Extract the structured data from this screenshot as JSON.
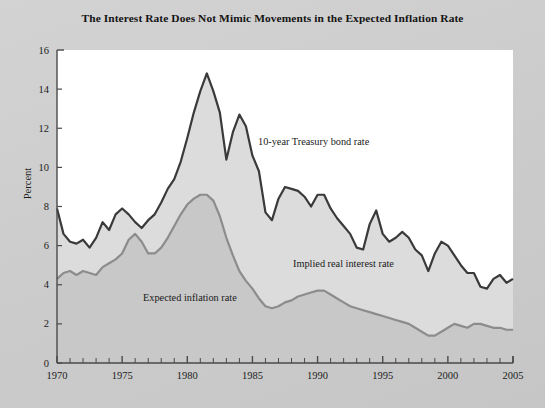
{
  "figure": {
    "title": "The Interest Rate Does Not Mimic Movements in the Expected Inflation Rate",
    "background_color": "#cdcdcd",
    "plot_background_color": "#ffffff"
  },
  "axes": {
    "ylabel": "Percent",
    "ytick_labels": [
      "0",
      "2",
      "4",
      "6",
      "8",
      "10",
      "12",
      "14",
      "16"
    ],
    "xtick_labels": [
      "1970",
      "1975",
      "1980",
      "1985",
      "1990",
      "1995",
      "2000",
      "2005"
    ]
  },
  "annotations": {
    "treasury": "10-year Treasury bond rate",
    "real": "Implied real interest rate",
    "inflation": "Expected inflation rate"
  },
  "colors": {
    "treasury_line": "#3a3a3a",
    "inflation_line": "#8c8c8c",
    "band_fill": "#dcdcdc",
    "inflation_fill": "#c8c8c8",
    "axis": "#4a4a4a",
    "title_text": "#141414"
  },
  "chart_data": {
    "type": "area",
    "title": "The Interest Rate Does Not Mimic Movements in the Expected Inflation Rate",
    "xlabel": "",
    "ylabel": "Percent",
    "xlim": [
      1970,
      2005
    ],
    "ylim": [
      0,
      16
    ],
    "xticks": [
      1970,
      1975,
      1980,
      1985,
      1990,
      1995,
      2000,
      2005
    ],
    "yticks": [
      0,
      2,
      4,
      6,
      8,
      10,
      12,
      14,
      16
    ],
    "minor_xtick_interval": 1,
    "grid": false,
    "legend": "inline-annotations",
    "x": [
      1970,
      1970.5,
      1971,
      1971.5,
      1972,
      1972.5,
      1973,
      1973.5,
      1974,
      1974.5,
      1975,
      1975.5,
      1976,
      1976.5,
      1977,
      1977.5,
      1978,
      1978.5,
      1979,
      1979.5,
      1980,
      1980.5,
      1981,
      1981.5,
      1982,
      1982.5,
      1983,
      1983.5,
      1984,
      1984.5,
      1985,
      1985.5,
      1986,
      1986.5,
      1987,
      1987.5,
      1988,
      1988.5,
      1989,
      1989.5,
      1990,
      1990.5,
      1991,
      1991.5,
      1992,
      1992.5,
      1993,
      1993.5,
      1994,
      1994.5,
      1995,
      1995.5,
      1996,
      1996.5,
      1997,
      1997.5,
      1998,
      1998.5,
      1999,
      1999.5,
      2000,
      2000.5,
      2001,
      2001.5,
      2002,
      2002.5,
      2003,
      2003.5,
      2004,
      2004.5,
      2005
    ],
    "series": [
      {
        "name": "10-year Treasury bond rate",
        "color": "#3a3a3a",
        "values": [
          7.9,
          6.6,
          6.2,
          6.1,
          6.3,
          5.9,
          6.4,
          7.2,
          6.8,
          7.6,
          7.9,
          7.6,
          7.2,
          6.9,
          7.3,
          7.6,
          8.2,
          8.9,
          9.4,
          10.3,
          11.5,
          12.8,
          13.9,
          14.8,
          13.9,
          12.8,
          10.4,
          11.8,
          12.7,
          12.1,
          10.6,
          9.8,
          7.7,
          7.3,
          8.4,
          9.0,
          8.9,
          8.8,
          8.5,
          8.0,
          8.6,
          8.6,
          7.9,
          7.4,
          7.0,
          6.6,
          5.9,
          5.8,
          7.1,
          7.8,
          6.6,
          6.2,
          6.4,
          6.7,
          6.4,
          5.8,
          5.5,
          4.7,
          5.6,
          6.2,
          6.0,
          5.5,
          5.0,
          4.6,
          4.6,
          3.9,
          3.8,
          4.3,
          4.5,
          4.1,
          4.3
        ]
      },
      {
        "name": "Expected inflation rate",
        "color": "#8c8c8c",
        "values": [
          4.3,
          4.6,
          4.7,
          4.5,
          4.7,
          4.6,
          4.5,
          4.9,
          5.1,
          5.3,
          5.6,
          6.3,
          6.6,
          6.2,
          5.6,
          5.6,
          5.9,
          6.4,
          7.0,
          7.6,
          8.1,
          8.4,
          8.6,
          8.6,
          8.3,
          7.5,
          6.4,
          5.5,
          4.7,
          4.2,
          3.8,
          3.3,
          2.9,
          2.8,
          2.9,
          3.1,
          3.2,
          3.4,
          3.5,
          3.6,
          3.7,
          3.7,
          3.5,
          3.3,
          3.1,
          2.9,
          2.8,
          2.7,
          2.6,
          2.5,
          2.4,
          2.3,
          2.2,
          2.1,
          2.0,
          1.8,
          1.6,
          1.4,
          1.4,
          1.6,
          1.8,
          2.0,
          1.9,
          1.8,
          2.0,
          2.0,
          1.9,
          1.8,
          1.8,
          1.7,
          1.7
        ]
      }
    ],
    "derived_series": {
      "name": "Implied real interest rate",
      "description": "Shaded band between the 10-year Treasury bond rate and the expected inflation rate"
    }
  }
}
